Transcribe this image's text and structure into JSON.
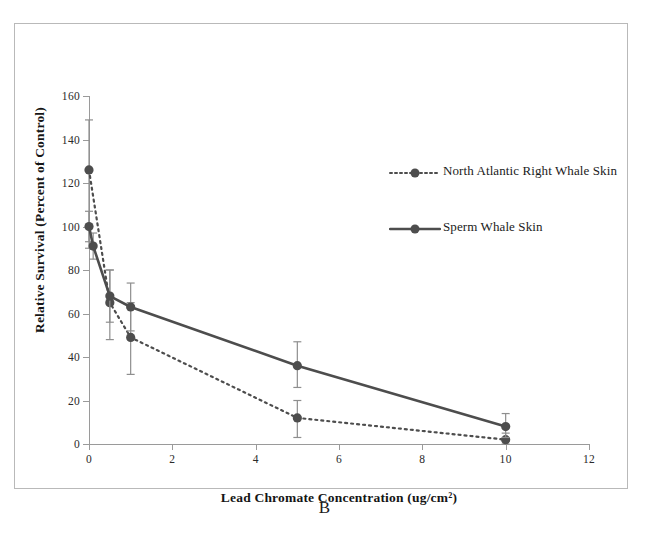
{
  "figure": {
    "panel_label": "B"
  },
  "chart_data": {
    "type": "line",
    "title": "",
    "xlabel": "Lead Chromate Concentration (ug/cm²)",
    "ylabel": "Relative Survival (Percent of Control)",
    "xlim": [
      0,
      12
    ],
    "ylim": [
      0,
      160
    ],
    "xticks": [
      0,
      2,
      4,
      6,
      8,
      10,
      12
    ],
    "yticks": [
      0,
      20,
      40,
      60,
      80,
      100,
      120,
      140,
      160
    ],
    "xtick_labels": [
      "0",
      "2",
      "4",
      "6",
      "8",
      "10",
      "12"
    ],
    "ytick_labels": [
      "0",
      "20",
      "40",
      "60",
      "80",
      "100",
      "120",
      "140",
      "160"
    ],
    "grid": false,
    "legend_position": "upper-right-inside",
    "error_bars": true,
    "series": [
      {
        "name": "North Atlantic Right Whale Skin",
        "line_style": "dotted",
        "marker": "circle",
        "color": "#4d4d4d",
        "x": [
          0,
          0.5,
          1,
          5,
          10
        ],
        "values": [
          126,
          65,
          49,
          12,
          2
        ],
        "err_low": [
          36,
          17,
          17,
          9,
          2
        ],
        "err_high": [
          23,
          15,
          16,
          8,
          3
        ]
      },
      {
        "name": "Sperm Whale Skin",
        "line_style": "solid",
        "marker": "circle",
        "color": "#4d4d4d",
        "x": [
          0,
          0.1,
          0.5,
          1,
          5,
          10
        ],
        "values": [
          100,
          91,
          68,
          63,
          36,
          8
        ],
        "err_low": [
          7,
          6,
          12,
          11,
          10,
          5
        ],
        "err_high": [
          7,
          6,
          12,
          11,
          11,
          6
        ]
      }
    ]
  },
  "legend": {
    "items": [
      {
        "label": "North Atlantic Right Whale Skin",
        "style": "dotted"
      },
      {
        "label": "Sperm Whale Skin",
        "style": "solid"
      }
    ]
  }
}
